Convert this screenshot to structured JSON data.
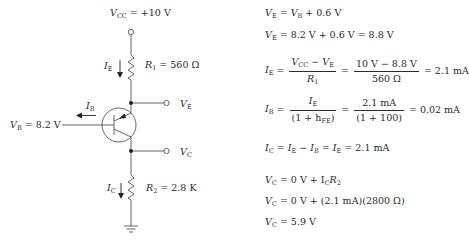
{
  "circuit": {
    "vcc_label": "= +10 V",
    "r1_label": "= 560 Ω",
    "r2_label": "= 2.8 K",
    "vb_label": "= 8.2 V",
    "ie_label": "I",
    "ie_sub": "E",
    "ib_label": "I",
    "ib_sub": "B",
    "ic_label": "I",
    "ic_sub": "C",
    "ve_label": "V",
    "ve_sub": "E",
    "vc_label": "V",
    "vc_sub": "C",
    "transistor_type": "PNP"
  },
  "equations": {
    "eq1": {
      "lhs": "V",
      "lhs_sub": "E",
      "rhs_v": "V",
      "rhs_sub": "B",
      "rhs_tail": "+ 0.6 V"
    },
    "eq2": {
      "lhs": "V",
      "lhs_sub": "E",
      "rhs": "= 8.2 V + 0.6 V = 8.8 V"
    },
    "eq3": {
      "lhs": "I",
      "lhs_sub": "E",
      "num1": "V",
      "num1_sub": "CC",
      "num1_mid": " − V",
      "num1_sub2": "E",
      "den1": "R",
      "den1_sub": "1",
      "num2": "10 V − 8.8 V",
      "den2": "560 Ω",
      "result": "= 2.1 mA"
    },
    "eq4": {
      "lhs": "I",
      "lhs_sub": "B",
      "num1": "I",
      "num1_sub": "E",
      "den1_a": "(1 + h",
      "den1_sub": "FE",
      "den1_b": ")",
      "num2": "2.1 mA",
      "den2": "(1 + 100)",
      "result": "= 0.02 mA"
    },
    "eq5": {
      "text": "I",
      "sub1": "C",
      "t2": " = I",
      "sub2": "E",
      "t3": " − I",
      "sub3": "B",
      "t4": " = I",
      "sub4": "E",
      "t5": " = 2.1 mA"
    },
    "eq6": {
      "lhs": "V",
      "lhs_sub": "C",
      "mid": " = 0 V + I",
      "mid_sub": "C",
      "r": "R",
      "r_sub": "2"
    },
    "eq7": {
      "lhs": "V",
      "lhs_sub": "C",
      "rhs": " = 0 V + (2.1 mA)(2800 Ω)"
    },
    "eq8": {
      "lhs": "V",
      "lhs_sub": "C",
      "rhs": " = 5.9 V"
    }
  }
}
